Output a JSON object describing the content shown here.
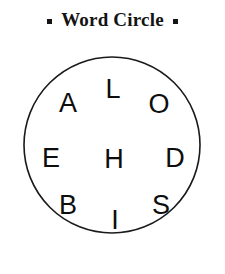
{
  "header": {
    "title": "Word Circle",
    "bullet_left": "square-bullet",
    "bullet_right": "square-bullet"
  },
  "puzzle": {
    "shape": "circle",
    "stroke_color": "#1a1a1a",
    "fill_color": "#ffffff",
    "text_color": "#0d0d0d",
    "center_x": 112,
    "center_y": 145,
    "radius": 88,
    "letter_count": 9,
    "letters": [
      {
        "char": "A",
        "x": 68,
        "y": 103
      },
      {
        "char": "L",
        "x": 113,
        "y": 89
      },
      {
        "char": "O",
        "x": 159,
        "y": 104
      },
      {
        "char": "E",
        "x": 51,
        "y": 158
      },
      {
        "char": "H",
        "x": 114,
        "y": 159
      },
      {
        "char": "D",
        "x": 175,
        "y": 158
      },
      {
        "char": "B",
        "x": 68,
        "y": 205
      },
      {
        "char": "I",
        "x": 115,
        "y": 220
      },
      {
        "char": "S",
        "x": 161,
        "y": 205
      }
    ],
    "letters_flat": "A L O E H D B I S"
  }
}
